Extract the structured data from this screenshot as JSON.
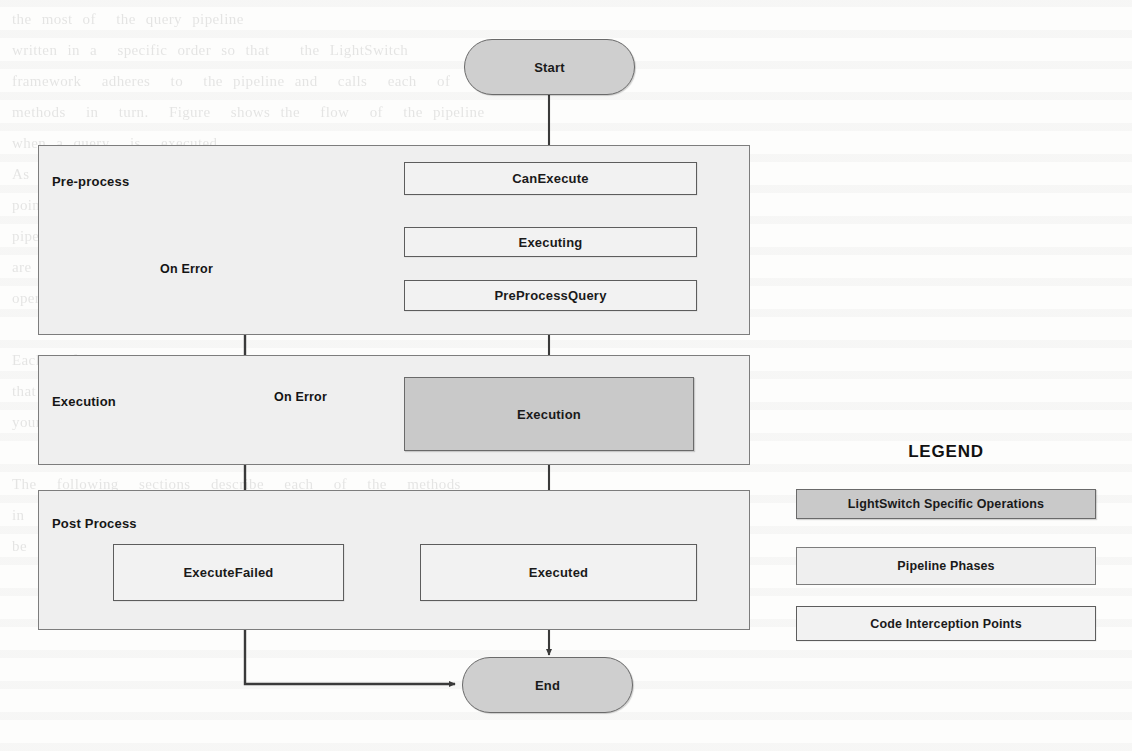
{
  "diagram": {
    "start_node": {
      "label": "Start"
    },
    "end_node": {
      "label": "End"
    },
    "phases": [
      {
        "id": "pre-process",
        "label": "Pre-process"
      },
      {
        "id": "execution",
        "label": "Execution"
      },
      {
        "id": "post-process",
        "label": "Post Process"
      }
    ],
    "nodes": [
      {
        "id": "can-execute",
        "label": "CanExecute",
        "kind": "code-interception-point",
        "phase": "pre-process"
      },
      {
        "id": "executing",
        "label": "Executing",
        "kind": "code-interception-point",
        "phase": "pre-process"
      },
      {
        "id": "pre-process-query",
        "label": "PreProcessQuery",
        "kind": "code-interception-point",
        "phase": "pre-process"
      },
      {
        "id": "execution-op",
        "label": "Execution",
        "kind": "lightswitch-specific-operation",
        "phase": "execution"
      },
      {
        "id": "execute-failed",
        "label": "ExecuteFailed",
        "kind": "code-interception-point",
        "phase": "post-process"
      },
      {
        "id": "executed",
        "label": "Executed",
        "kind": "code-interception-point",
        "phase": "post-process"
      }
    ],
    "edge_labels": {
      "on_error_preprocess": "On Error",
      "on_error_execution": "On Error"
    }
  },
  "legend": {
    "title": "LEGEND",
    "items": [
      {
        "id": "lightswitch-specific-operations",
        "label": "LightSwitch Specific Operations",
        "style": "lightswitch-op"
      },
      {
        "id": "pipeline-phases",
        "label": "Pipeline Phases",
        "style": "phase"
      },
      {
        "id": "code-interception-points",
        "label": "Code Interception Points",
        "style": "interception"
      }
    ]
  },
  "colors": {
    "terminator_fill": "#cfcfcf",
    "phase_fill": "#efefef",
    "interception_fill": "#f2f2f2",
    "lightswitch_fill": "#c9c9c9",
    "stroke": "#3a3a3a",
    "page_background": "#fdfdfc"
  },
  "background_ghost_text": "the most of  the query pipeline\nwritten in a  specific order so that   the LightSwitch\nframework  adheres  to  the pipeline and  calls  each  of  the\nmethods  in  turn.  Figure  shows the  flow  of  the pipeline\nwhen a query  is  executed.\nAs  you  can  see  from  the  figure  there  are  several\npoints  where  you  can  intercept  the  query  processing\npipeline  and  modify  the  behaviour.  The  pipeline  phases\nare  shown  as  the  light  grey  containers  and  the  actual\noperations  performed  by  the  runtime  are  darker.\n\nEach  of  the  interception  points  is  a  partial  method\nthat  you  can  implement  in  the  server  project  to  add\nyour  own  logic.\n\nThe  following  sections  describe  each  of  the  methods\nin  more  detail  and  show  examples  of  how  they  can\nbe  used  to  add  validation  and  filtering."
}
